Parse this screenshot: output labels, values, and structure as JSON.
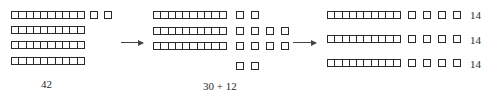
{
  "diagram": {
    "colors": {
      "stroke": "#2a2a2a",
      "arrow": "#444444",
      "background": "#ffffff"
    },
    "stages": [
      {
        "name": "initial",
        "tens": 4,
        "ones": 2,
        "label": "42"
      },
      {
        "name": "regrouped",
        "tens": 3,
        "ones": 12,
        "ones_rows": [
          2,
          4,
          4,
          2
        ],
        "label": "30 + 12"
      },
      {
        "name": "divided",
        "groups": [
          {
            "tens": 1,
            "ones": 4,
            "label": "14"
          },
          {
            "tens": 1,
            "ones": 4,
            "label": "14"
          },
          {
            "tens": 1,
            "ones": 4,
            "label": "14"
          }
        ]
      }
    ],
    "arrows": [
      {
        "from": "initial",
        "to": "regrouped"
      },
      {
        "from": "regrouped",
        "to": "divided"
      }
    ]
  }
}
